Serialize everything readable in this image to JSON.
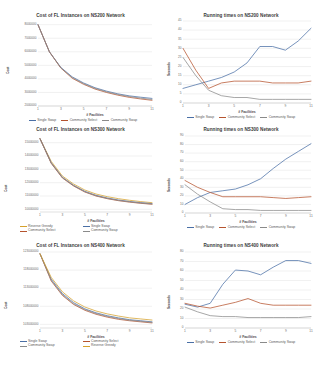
{
  "figure": {
    "panel_count": 6,
    "layout": "2 columns x 3 rows"
  },
  "series_colors": {
    "single_swap": "#4a6fa5",
    "community_select": "#b5532e",
    "community_swap": "#8a8a8a",
    "reverse_greedy": "#d6a12c"
  },
  "panels": [
    {
      "id": "cost-ns200",
      "title": "Cost of FL Instances on NS200 Network",
      "ylabel": "Cost",
      "xlabel": "# Facilities",
      "legend": [
        "Single Swap",
        "Community Select",
        "Community Swap"
      ]
    },
    {
      "id": "runtime-ns200",
      "title": "Running times on NS200 Network",
      "ylabel": "Seconds",
      "xlabel": "# Facilities",
      "legend": [
        "Single Swap",
        "Community Select",
        "Community Swap"
      ]
    },
    {
      "id": "cost-ns300",
      "title": "Cost of FL Instances on NS300 Network",
      "ylabel": "Cost",
      "xlabel": "# Facilities",
      "legend": [
        "Reverse Greedy",
        "Single Swap",
        "Community Select",
        "Community Swap"
      ]
    },
    {
      "id": "runtime-ns300",
      "title": "Running times on NS300 Network",
      "ylabel": "Seconds",
      "xlabel": "# Facilities",
      "legend": [
        "Single Swap",
        "Community Select",
        "Community Swap"
      ]
    },
    {
      "id": "cost-ns400",
      "title": "Cost of FL Instances on NS400 Network",
      "ylabel": "Cost",
      "xlabel": "# Facilities",
      "legend": [
        "Single Swap",
        "Community Select",
        "Community Swap",
        "Reverse Greedy"
      ]
    },
    {
      "id": "runtime-ns400",
      "title": "Running times on NS400 Network",
      "ylabel": "Seconds",
      "xlabel": "# Facilities",
      "legend": [
        "Single Swap",
        "Community Select",
        "Community Swap"
      ]
    }
  ],
  "chart_data": [
    {
      "type": "line",
      "id": "cost-ns200",
      "title": "Cost of FL Instances on NS200 Network",
      "xlabel": "# Facilities",
      "ylabel": "Cost",
      "x": [
        1,
        2,
        3,
        4,
        5,
        6,
        7,
        8,
        9,
        10,
        11
      ],
      "xticks": [
        1,
        3,
        5,
        7,
        9,
        11
      ],
      "yticks": [
        2000000,
        3000000,
        4000000,
        5000000,
        6000000,
        7000000,
        8000000
      ],
      "ytick_labels": [
        "2000000",
        "3000000",
        "4000000",
        "5000000",
        "6000000",
        "7000000",
        "8000000"
      ],
      "ylim": [
        2000000,
        8200000
      ],
      "grid": true,
      "legend_position": "bottom",
      "series": [
        {
          "name": "Single Swap",
          "values": [
            8000000,
            6000000,
            4850000,
            4150000,
            3700000,
            3350000,
            3100000,
            2900000,
            2750000,
            2650000,
            2560000
          ]
        },
        {
          "name": "Community Select",
          "values": [
            8000000,
            6000000,
            4800000,
            4050000,
            3600000,
            3250000,
            3000000,
            2800000,
            2640000,
            2520000,
            2420000
          ]
        },
        {
          "name": "Community Swap",
          "values": [
            8000000,
            6000000,
            4820000,
            4100000,
            3650000,
            3300000,
            3050000,
            2850000,
            2700000,
            2580000,
            2480000
          ]
        }
      ]
    },
    {
      "type": "line",
      "id": "runtime-ns200",
      "title": "Running times on NS200 Network",
      "xlabel": "# Facilities",
      "ylabel": "Seconds",
      "x": [
        1,
        2,
        3,
        4,
        5,
        6,
        7,
        8,
        9,
        10,
        11
      ],
      "xticks": [
        1,
        3,
        5,
        7,
        9,
        11
      ],
      "yticks": [
        0,
        5,
        10,
        15,
        20,
        25,
        30,
        35,
        40,
        45
      ],
      "ytick_labels": [
        "0",
        "5",
        "10",
        "15",
        "20",
        "25",
        "30",
        "35",
        "40",
        "45"
      ],
      "ylim": [
        0,
        45
      ],
      "grid": true,
      "legend_position": "bottom",
      "series": [
        {
          "name": "Single Swap",
          "values": [
            8,
            10,
            12,
            14,
            17,
            22,
            31,
            31,
            29,
            34,
            41
          ]
        },
        {
          "name": "Community Select",
          "values": [
            30,
            18,
            8,
            11,
            12,
            12,
            12,
            11,
            11,
            11,
            12
          ]
        },
        {
          "name": "Community Swap",
          "values": [
            25,
            15,
            7,
            4,
            3,
            3,
            2,
            2,
            2,
            2,
            2
          ]
        }
      ]
    },
    {
      "type": "line",
      "id": "cost-ns300",
      "title": "Cost of FL Instances on NS300 Network",
      "xlabel": "# Facilities",
      "ylabel": "Cost",
      "x": [
        1,
        2,
        3,
        4,
        5,
        6,
        7,
        8,
        9,
        10,
        11
      ],
      "xticks": [
        1,
        3,
        5,
        7,
        9,
        11
      ],
      "yticks": [
        10000000,
        11000000,
        12000000,
        13000000,
        14000000,
        15000000
      ],
      "ytick_labels": [
        "10000000",
        "11000000",
        "12000000",
        "13000000",
        "14000000",
        "15000000"
      ],
      "ylim": [
        9800000,
        15500000
      ],
      "grid": true,
      "legend_position": "bottom",
      "series": [
        {
          "name": "Reverse Greedy",
          "values": [
            15300000,
            13600000,
            12500000,
            11900000,
            11450000,
            11150000,
            10950000,
            10800000,
            10680000,
            10580000,
            10500000
          ]
        },
        {
          "name": "Single Swap",
          "values": [
            15300000,
            13500000,
            12400000,
            11800000,
            11350000,
            11050000,
            10850000,
            10700000,
            10590000,
            10500000,
            10430000
          ]
        },
        {
          "name": "Community Select",
          "values": [
            15300000,
            13450000,
            12350000,
            11750000,
            11300000,
            11000000,
            10800000,
            10650000,
            10540000,
            10450000,
            10380000
          ]
        },
        {
          "name": "Community Swap",
          "values": [
            15300000,
            13480000,
            12380000,
            11780000,
            11320000,
            11020000,
            10820000,
            10670000,
            10560000,
            10470000,
            10400000
          ]
        }
      ]
    },
    {
      "type": "line",
      "id": "runtime-ns300",
      "title": "Running times on NS300 Network",
      "xlabel": "# Facilities",
      "ylabel": "Seconds",
      "x": [
        1,
        2,
        3,
        4,
        5,
        6,
        7,
        8,
        9,
        10,
        11
      ],
      "xticks": [
        1,
        3,
        5,
        7,
        9,
        11
      ],
      "yticks": [
        0,
        10,
        20,
        30,
        40,
        50,
        60,
        70,
        80,
        90
      ],
      "ytick_labels": [
        "0",
        "10",
        "20",
        "30",
        "40",
        "50",
        "60",
        "70",
        "80",
        "90"
      ],
      "ylim": [
        0,
        90
      ],
      "grid": true,
      "legend_position": "bottom",
      "series": [
        {
          "name": "Single Swap",
          "values": [
            10,
            18,
            24,
            26,
            28,
            33,
            40,
            52,
            63,
            72,
            81
          ]
        },
        {
          "name": "Community Select",
          "values": [
            38,
            30,
            24,
            19,
            19,
            19,
            19,
            18,
            17,
            18,
            19
          ]
        },
        {
          "name": "Community Swap",
          "values": [
            33,
            22,
            13,
            5,
            4,
            4,
            3,
            3,
            3,
            3,
            3
          ]
        }
      ]
    },
    {
      "type": "line",
      "id": "cost-ns400",
      "title": "Cost of FL Instances on NS400 Network",
      "xlabel": "# Facilities",
      "ylabel": "Cost",
      "x": [
        1,
        2,
        3,
        4,
        5,
        6,
        7,
        8,
        9,
        10,
        11
      ],
      "xticks": [
        1,
        3,
        5,
        7,
        9,
        11
      ],
      "yticks": [
        103000000,
        108000000,
        113000000,
        118000000,
        123000000
      ],
      "ytick_labels": [
        "103000000",
        "108000000",
        "113000000",
        "118000000",
        "123000000"
      ],
      "ylim": [
        102000000,
        123000000
      ],
      "grid": true,
      "legend_position": "bottom",
      "series": [
        {
          "name": "Single Swap",
          "values": [
            122500000,
            115500000,
            111500000,
            109000000,
            107300000,
            106200000,
            105400000,
            104800000,
            104300000,
            104000000,
            103700000
          ]
        },
        {
          "name": "Community Select",
          "values": [
            122500000,
            115000000,
            111000000,
            108500000,
            106900000,
            105800000,
            105000000,
            104400000,
            104000000,
            103700000,
            103400000
          ]
        },
        {
          "name": "Community Swap",
          "values": [
            122500000,
            115200000,
            111200000,
            108700000,
            107100000,
            106000000,
            105200000,
            104600000,
            104150000,
            103850000,
            103550000
          ]
        },
        {
          "name": "Reverse Greedy",
          "values": [
            122500000,
            116000000,
            112000000,
            109500000,
            107800000,
            106700000,
            105900000,
            105300000,
            104800000,
            104500000,
            104200000
          ]
        }
      ]
    },
    {
      "type": "line",
      "id": "runtime-ns400",
      "title": "Running times on NS400 Network",
      "xlabel": "# Facilities",
      "ylabel": "Seconds",
      "x": [
        1,
        2,
        3,
        4,
        5,
        6,
        7,
        8,
        9,
        10,
        11
      ],
      "xticks": [
        1,
        3,
        5,
        7,
        9,
        11
      ],
      "yticks": [
        0,
        10,
        20,
        30,
        40,
        50,
        60,
        70,
        80
      ],
      "ytick_labels": [
        "0",
        "10",
        "20",
        "30",
        "40",
        "50",
        "60",
        "70",
        "80"
      ],
      "ylim": [
        0,
        80
      ],
      "grid": true,
      "legend_position": "bottom",
      "series": [
        {
          "name": "Single Swap",
          "values": [
            25,
            22,
            26,
            46,
            61,
            60,
            56,
            64,
            71,
            71,
            68
          ]
        },
        {
          "name": "Community Select",
          "values": [
            26,
            23,
            21,
            24,
            27,
            31,
            26,
            24,
            24,
            24,
            24
          ]
        },
        {
          "name": "Community Swap",
          "values": [
            22,
            17,
            13,
            12,
            12,
            11,
            11,
            11,
            11,
            11,
            12
          ]
        }
      ]
    }
  ]
}
